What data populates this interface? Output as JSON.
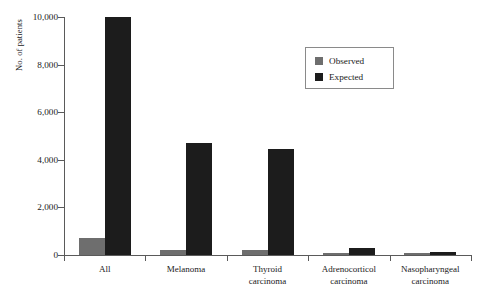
{
  "chart_data": {
    "type": "bar",
    "title": "",
    "xlabel": "",
    "ylabel": "No. of patients",
    "ylim": [
      0,
      10000
    ],
    "yticks": [
      "0",
      "2,000",
      "4,000",
      "6,000",
      "8,000",
      "10,000"
    ],
    "ytick_values": [
      0,
      2000,
      4000,
      6000,
      8000,
      10000
    ],
    "grid": false,
    "legend_position": "top-right",
    "categories": [
      "All",
      "Melanoma",
      "Thyroid carcinoma",
      "Adrenocorticol carcinoma",
      "Nasopharyngeal carcinoma"
    ],
    "category_lines": [
      [
        "All"
      ],
      [
        "Melanoma"
      ],
      [
        "Thyroid",
        "carcinoma"
      ],
      [
        "Adrenocorticol",
        "carcinoma"
      ],
      [
        "Nasopharyngeal",
        "carcinoma"
      ]
    ],
    "series": [
      {
        "name": "Observed",
        "color": "#6e6e6e",
        "values": [
          700,
          200,
          200,
          100,
          100
        ]
      },
      {
        "name": "Expected",
        "color": "#1c1c1c",
        "values": [
          10000,
          4700,
          4450,
          300,
          130
        ]
      }
    ]
  },
  "legend": {
    "entries": [
      {
        "label": "Observed"
      },
      {
        "label": "Expected"
      }
    ]
  }
}
